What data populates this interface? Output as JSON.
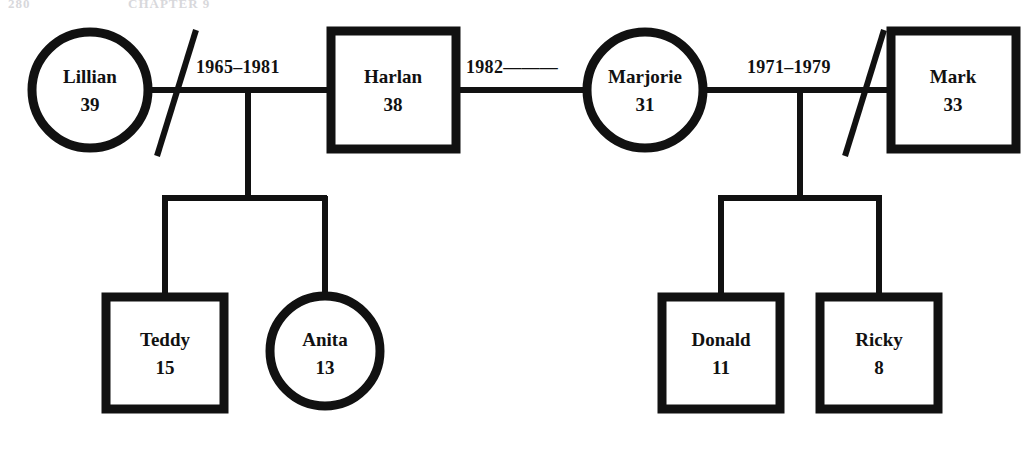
{
  "page": {
    "header_folio": "280",
    "header_title": "CHAPTER 9",
    "background_color": "#ffffff",
    "ink_color": "#111111",
    "width": 1033,
    "height": 450
  },
  "diagram": {
    "type": "genogram",
    "legend": {
      "square_meaning": "male",
      "circle_meaning": "female",
      "double_slash_meaning": "divorce",
      "dashed_line_meaning": "cohabiting / current union"
    },
    "persons": [
      {
        "id": "lillian",
        "name": "Lillian",
        "age": "39",
        "symbol": "circle",
        "gender": "female",
        "generation": 1,
        "cx": 90,
        "cy": 90,
        "r": 58
      },
      {
        "id": "harlan",
        "name": "Harlan",
        "age": "38",
        "symbol": "square",
        "gender": "male",
        "generation": 1,
        "x": 331,
        "y": 31,
        "w": 125,
        "h": 118
      },
      {
        "id": "marjorie",
        "name": "Marjorie",
        "age": "31",
        "symbol": "circle",
        "gender": "female",
        "generation": 1,
        "cx": 645,
        "cy": 90,
        "r": 58
      },
      {
        "id": "mark",
        "name": "Mark",
        "age": "33",
        "symbol": "square",
        "gender": "male",
        "generation": 1,
        "x": 891,
        "y": 31,
        "w": 125,
        "h": 118
      },
      {
        "id": "teddy",
        "name": "Teddy",
        "age": "15",
        "symbol": "square",
        "gender": "male",
        "generation": 2,
        "x": 106,
        "y": 297,
        "w": 118,
        "h": 112
      },
      {
        "id": "anita",
        "name": "Anita",
        "age": "13",
        "symbol": "circle",
        "gender": "female",
        "generation": 2,
        "cx": 325,
        "cy": 351,
        "r": 55
      },
      {
        "id": "donald",
        "name": "Donald",
        "age": "11",
        "symbol": "square",
        "gender": "male",
        "generation": 2,
        "x": 662,
        "y": 297,
        "w": 118,
        "h": 112
      },
      {
        "id": "ricky",
        "name": "Ricky",
        "age": "8",
        "symbol": "square",
        "gender": "male",
        "generation": 2,
        "x": 820,
        "y": 297,
        "w": 118,
        "h": 112
      }
    ],
    "relationships": [
      {
        "id": "lillian-harlan",
        "partners": [
          "lillian",
          "harlan"
        ],
        "label": "1965–1981",
        "label_x": 196,
        "label_y": 73,
        "status": "divorced",
        "line_style": "solid",
        "children": [
          "teddy",
          "anita"
        ]
      },
      {
        "id": "harlan-marjorie",
        "partners": [
          "harlan",
          "marjorie"
        ],
        "label": "1982———",
        "label_x": 466,
        "label_y": 73,
        "status": "current",
        "line_style": "solid",
        "children": []
      },
      {
        "id": "marjorie-mark",
        "partners": [
          "marjorie",
          "mark"
        ],
        "label": "1971–1979",
        "label_x": 747,
        "label_y": 73,
        "status": "divorced",
        "line_style": "solid",
        "children": [
          "donald",
          "ricky"
        ]
      }
    ]
  }
}
